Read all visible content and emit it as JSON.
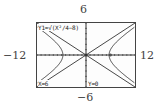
{
  "window": {
    "xmin_label": "−12",
    "xmax_label": "12",
    "ymin_label": "−6",
    "ymax_label": "6"
  },
  "screen": {
    "function_label": "Y1=√(X²/4−8)",
    "cursor_x_label": "X=6",
    "cursor_y_label": "Y=0"
  },
  "chart_data": {
    "type": "line",
    "title": "",
    "xlabel": "",
    "ylabel": "",
    "xlim": [
      -12,
      12
    ],
    "ylim": [
      -6,
      6
    ],
    "grid": false,
    "axes_ticks": {
      "x_step": 1,
      "y_step": 1
    },
    "series": [
      {
        "name": "Hyperbola x²/4 − y² = 8 (both branches)",
        "equation": "y = ±√(x²/4 − 8)",
        "vertices": [
          [
            -5.66,
            0
          ],
          [
            5.66,
            0
          ]
        ]
      },
      {
        "name": "Asymptote y = x/2",
        "equation": "y = x/2"
      },
      {
        "name": "Asymptote y = −x/2",
        "equation": "y = -x/2"
      }
    ],
    "annotations": [
      "Y1=√(X²/4−8)",
      "X=6",
      "Y=0"
    ],
    "colors": {
      "curve": "#333333",
      "axes": "#333333",
      "frame": "#444444"
    }
  }
}
